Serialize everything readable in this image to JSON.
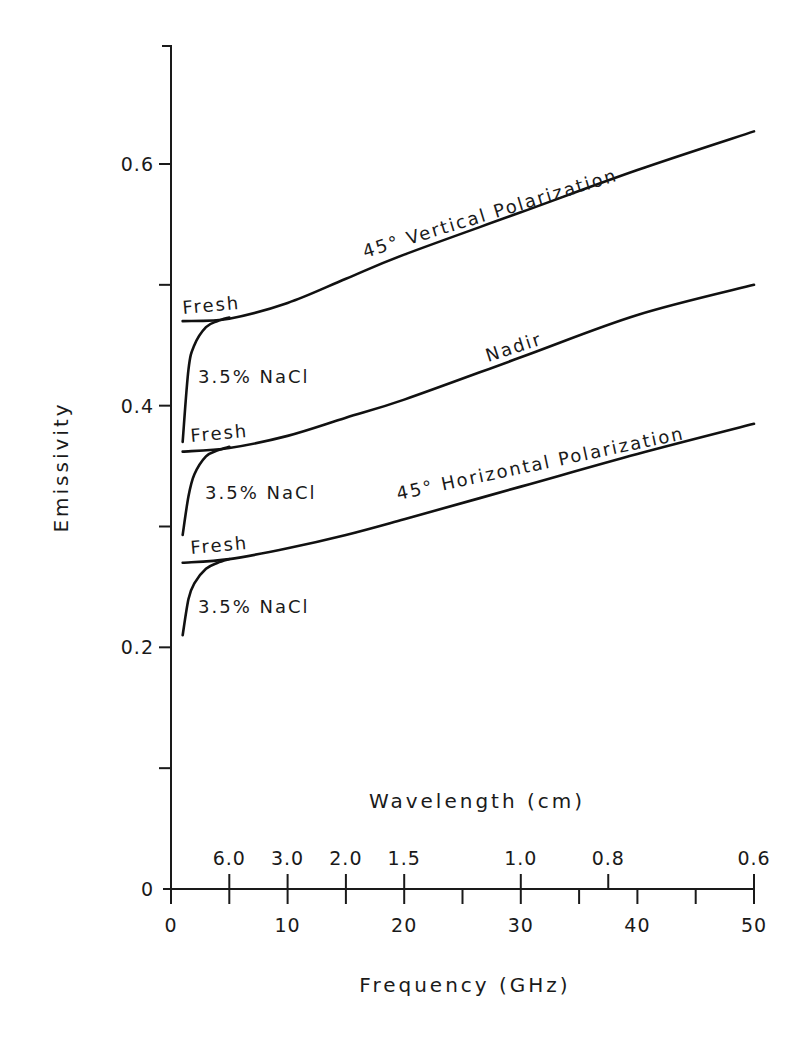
{
  "chart_data": {
    "type": "line",
    "title": "",
    "xlabel": "Frequency (GHz)",
    "ylabel": "Emissivity",
    "secondary_xlabel": "Wavelength (cm)",
    "xlim": [
      0,
      50
    ],
    "ylim": [
      0,
      0.7
    ],
    "grid": false,
    "x_ticks": [
      0,
      10,
      20,
      30,
      40,
      50
    ],
    "x_tick_labels": [
      "0",
      "10",
      "20",
      "30",
      "40",
      "50"
    ],
    "x_minor_ticks": [
      5,
      15,
      25,
      35,
      45
    ],
    "y_ticks": [
      0,
      0.2,
      0.4,
      0.6
    ],
    "y_tick_labels": [
      "0",
      "0.2",
      "0.4",
      "0.6"
    ],
    "y_minor_ticks": [
      0.1,
      0.3,
      0.5
    ],
    "wavelength_ticks": [
      {
        "freq": 5,
        "label": "6.0"
      },
      {
        "freq": 10,
        "label": "3.0"
      },
      {
        "freq": 15,
        "label": "2.0"
      },
      {
        "freq": 20,
        "label": "1.5"
      },
      {
        "freq": 30,
        "label": "1.0"
      },
      {
        "freq": 37.5,
        "label": "0.8"
      },
      {
        "freq": 50,
        "label": "0.6"
      }
    ],
    "series": [
      {
        "name": "45° Vertical Polarization (Fresh)",
        "x": [
          1,
          5,
          10,
          15,
          20,
          30,
          40,
          50
        ],
        "y": [
          0.47,
          0.472,
          0.485,
          0.505,
          0.525,
          0.56,
          0.595,
          0.627
        ]
      },
      {
        "name": "45° Vertical Polarization (3.5% NaCl)",
        "x": [
          1,
          1.5,
          2,
          3,
          4,
          5
        ],
        "y": [
          0.37,
          0.43,
          0.45,
          0.465,
          0.47,
          0.473
        ]
      },
      {
        "name": "Nadir (Fresh)",
        "x": [
          1,
          5,
          10,
          15,
          20,
          30,
          40,
          50
        ],
        "y": [
          0.362,
          0.365,
          0.375,
          0.39,
          0.405,
          0.44,
          0.475,
          0.5
        ]
      },
      {
        "name": "Nadir (3.5% NaCl)",
        "x": [
          1,
          1.5,
          2,
          3,
          4,
          5
        ],
        "y": [
          0.293,
          0.325,
          0.343,
          0.358,
          0.363,
          0.366
        ]
      },
      {
        "name": "45° Horizontal Polarization (Fresh)",
        "x": [
          1,
          5,
          10,
          15,
          20,
          30,
          40,
          50
        ],
        "y": [
          0.27,
          0.273,
          0.282,
          0.293,
          0.306,
          0.333,
          0.36,
          0.385
        ]
      },
      {
        "name": "45° Horizontal Polarization (3.5% NaCl)",
        "x": [
          1,
          1.5,
          2,
          3,
          4,
          5
        ],
        "y": [
          0.21,
          0.24,
          0.253,
          0.265,
          0.27,
          0.273
        ]
      }
    ],
    "annotations": {
      "vertical": "45° Vertical Polarization",
      "nadir": "Nadir",
      "horizontal": "45° Horizontal Polarization",
      "fresh": "Fresh",
      "nacl": "3.5% NaCl"
    }
  }
}
